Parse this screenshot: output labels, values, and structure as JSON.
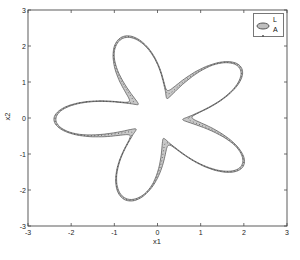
{
  "figure": {
    "background": "#ffffff",
    "plot_background": "#ffffff",
    "border_color": "#4a4a4a",
    "tick_color": "#4a4a4a",
    "text_color": "#222222"
  },
  "axes": {
    "x": {
      "label": "x1",
      "range": [
        -3,
        3
      ],
      "ticks": [
        -3,
        -2,
        -1,
        0,
        1,
        2,
        3
      ]
    },
    "y": {
      "label": "x2",
      "range": [
        -3,
        3
      ],
      "ticks": [
        -3,
        -2,
        -1,
        0,
        1,
        2,
        3
      ]
    }
  },
  "legend": {
    "position": "top-right",
    "items": [
      {
        "label": "L",
        "marker": "filled-ellipse",
        "fill": "#bfbfbf",
        "stroke": "#555555"
      },
      {
        "label": "A",
        "marker": "dot",
        "color": "#555555"
      }
    ]
  },
  "chart_data": {
    "type": "area",
    "title": "",
    "xlabel": "x1",
    "ylabel": "x2",
    "xlim": [
      -3,
      3
    ],
    "ylim": [
      -3,
      3
    ],
    "grid": false,
    "legend_position": "top-right",
    "star": {
      "freq": 5,
      "outer": {
        "base": 1.6,
        "amp": 0.8,
        "phase_deg": 175
      },
      "gap": {
        "base": 0.045,
        "amp": 0.33,
        "phase_deg": 225,
        "power": 3
      },
      "band_fill": "#c8c8c8",
      "edge_color": "#606060",
      "dotted_color": "#333333",
      "tip_radius": 2.4,
      "notch_radius": 0.8,
      "tip_angles_deg": [
        37,
        109,
        181,
        253,
        325
      ],
      "tip_points": [
        [
          1.92,
          1.44
        ],
        [
          -0.78,
          2.27
        ],
        [
          -2.4,
          -0.04
        ],
        [
          -0.7,
          -2.3
        ],
        [
          1.97,
          -1.38
        ]
      ]
    }
  }
}
